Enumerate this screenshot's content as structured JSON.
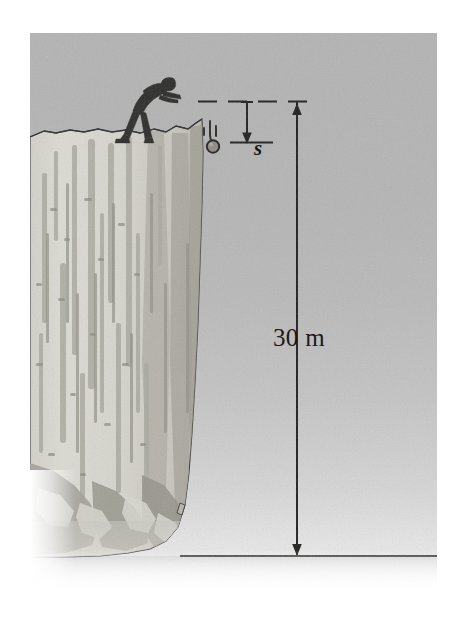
{
  "figure": {
    "panel": {
      "x": 30,
      "y": 33,
      "width": 407,
      "height": 557
    },
    "background_color": "#ffffff",
    "sky_color_top": "#b3b3b3",
    "sky_color_horizon": "#f2f2f2"
  },
  "annotations": {
    "height_label": "30 m",
    "displacement_label": "s"
  },
  "measurements": {
    "cliff_height_value": 30,
    "cliff_height_unit": "m",
    "displacement_symbol": "s"
  },
  "elements": {
    "person": "man-figure",
    "projectile": "falling-stone",
    "terrain": "rock-cliff",
    "ground": "ground-plane",
    "top_reference": "dashed-top-line",
    "bottom_reference": "dashed-drop-line"
  },
  "icons": {
    "dimension_arrow": "double-arrow-icon",
    "drop_arrow": "down-arrow-icon",
    "motion_trail": "motion-lines-icon"
  },
  "colors": {
    "ink": "#1a1a1a",
    "rock_light": "#dcdad4",
    "rock_mid": "#c2c0b8",
    "rock_shadow": "#a9a79f",
    "rock_dark": "#8f8d86"
  }
}
